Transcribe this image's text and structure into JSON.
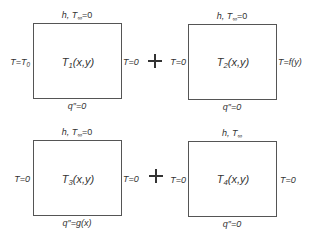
{
  "diagram": {
    "type": "superposition of 2D heat conduction subproblems",
    "operator": "+",
    "panels": [
      {
        "id": "T1",
        "solution_base": "T",
        "solution_sub": "1",
        "solution_args": "(x,y)",
        "top": {
          "prefix": "h, T",
          "sub": "∞",
          "suffix": "=0"
        },
        "left": {
          "prefix": "T=T",
          "sub": "0"
        },
        "right": {
          "text": "T=0"
        },
        "bottom": {
          "text": "q″=0"
        }
      },
      {
        "id": "T2",
        "solution_base": "T",
        "solution_sub": "2",
        "solution_args": "(x,y)",
        "top": {
          "prefix": "h, T",
          "sub": "∞",
          "suffix": "=0"
        },
        "left": {
          "text": "T=0"
        },
        "right": {
          "text": "T=f(y)"
        },
        "bottom": {
          "text": "q″=0"
        }
      },
      {
        "id": "T3",
        "solution_base": "T",
        "solution_sub": "3",
        "solution_args": "(x,y)",
        "top": {
          "prefix": "h, T",
          "sub": "∞",
          "suffix": "=0"
        },
        "left": {
          "text": "T=0"
        },
        "right": {
          "text": "T=0"
        },
        "bottom": {
          "text": "q″=g(x)"
        }
      },
      {
        "id": "T4",
        "solution_base": "T",
        "solution_sub": "4",
        "solution_args": "(x,y)",
        "top": {
          "prefix": "h, T",
          "sub": "∞",
          "suffix": ""
        },
        "left": {
          "text": "T=0"
        },
        "right": {
          "text": "T=0"
        },
        "bottom": {
          "text": "q″=0"
        }
      }
    ],
    "colors": {
      "line": "#555555",
      "text": "#333333",
      "background": "#ffffff"
    }
  }
}
